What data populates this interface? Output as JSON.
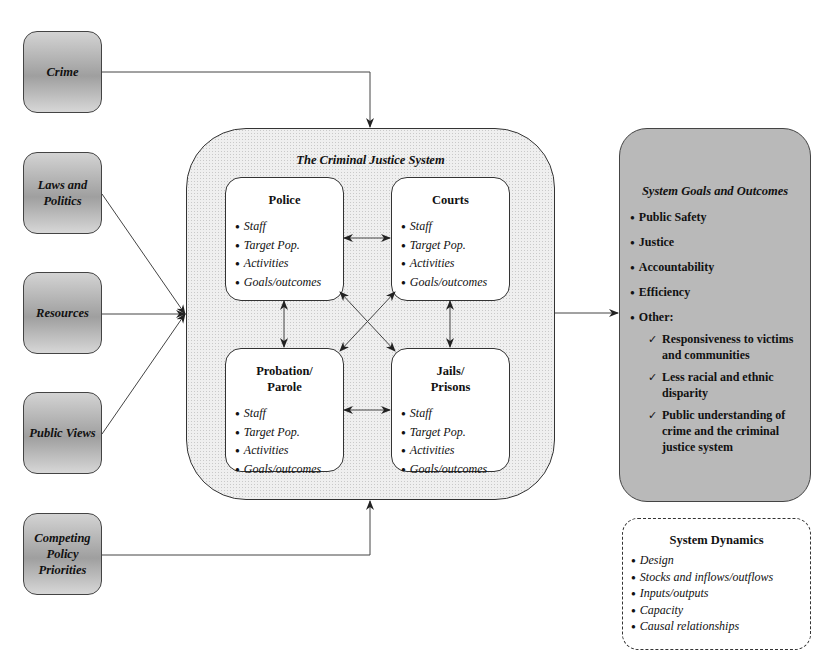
{
  "inputs": [
    {
      "label": "Crime"
    },
    {
      "label": "Laws and Politics"
    },
    {
      "label": "Resources"
    },
    {
      "label": "Public Views"
    },
    {
      "label": "Competing Policy Priorities"
    }
  ],
  "system": {
    "title": "The Criminal Justice System",
    "agencies": [
      {
        "title": "Police",
        "items": [
          "Staff",
          "Target Pop.",
          "Activities",
          "Goals/outcomes"
        ]
      },
      {
        "title": "Courts",
        "items": [
          "Staff",
          "Target Pop.",
          "Activities",
          "Goals/outcomes"
        ]
      },
      {
        "title": "Probation/ Parole",
        "items": [
          "Staff",
          "Target Pop.",
          "Activities",
          "Goals/outcomes"
        ]
      },
      {
        "title": "Jails/ Prisons",
        "items": [
          "Staff",
          "Target Pop.",
          "Activities",
          "Goals/outcomes"
        ]
      }
    ]
  },
  "goals": {
    "title": "System Goals and Outcomes",
    "items": [
      "Public Safety",
      "Justice",
      "Accountability",
      "Efficiency",
      "Other:"
    ],
    "other_items": [
      "Responsiveness to victims and communities",
      "Less racial and ethnic disparity",
      "Public understanding of crime and the criminal justice system"
    ],
    "bullet_glyph": "●",
    "check_glyph": "✓"
  },
  "dynamics": {
    "title": "System Dynamics",
    "items": [
      "Design",
      "Stocks and inflows/outflows",
      "Inputs/outputs",
      "Capacity",
      "Causal relationships"
    ]
  },
  "colors": {
    "input_fill": "#b0b0b0",
    "goals_fill": "#b9b9b9",
    "system_fill": "#efefef",
    "stroke": "#333333"
  }
}
